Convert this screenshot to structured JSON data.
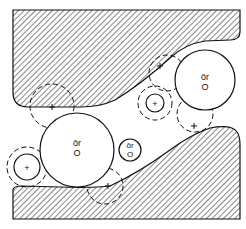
{
  "diagram": {
    "labels": {
      "large_right": {
        "top": "ōr",
        "bottom": "O"
      },
      "large_left": {
        "top": "ōr",
        "bottom": "O"
      },
      "small_middle": {
        "top": "ōr",
        "bottom": "O"
      },
      "plus_upper": "+",
      "plus_left": "+"
    },
    "colors": {
      "stroke": "#111111",
      "background": "#ffffff"
    }
  }
}
